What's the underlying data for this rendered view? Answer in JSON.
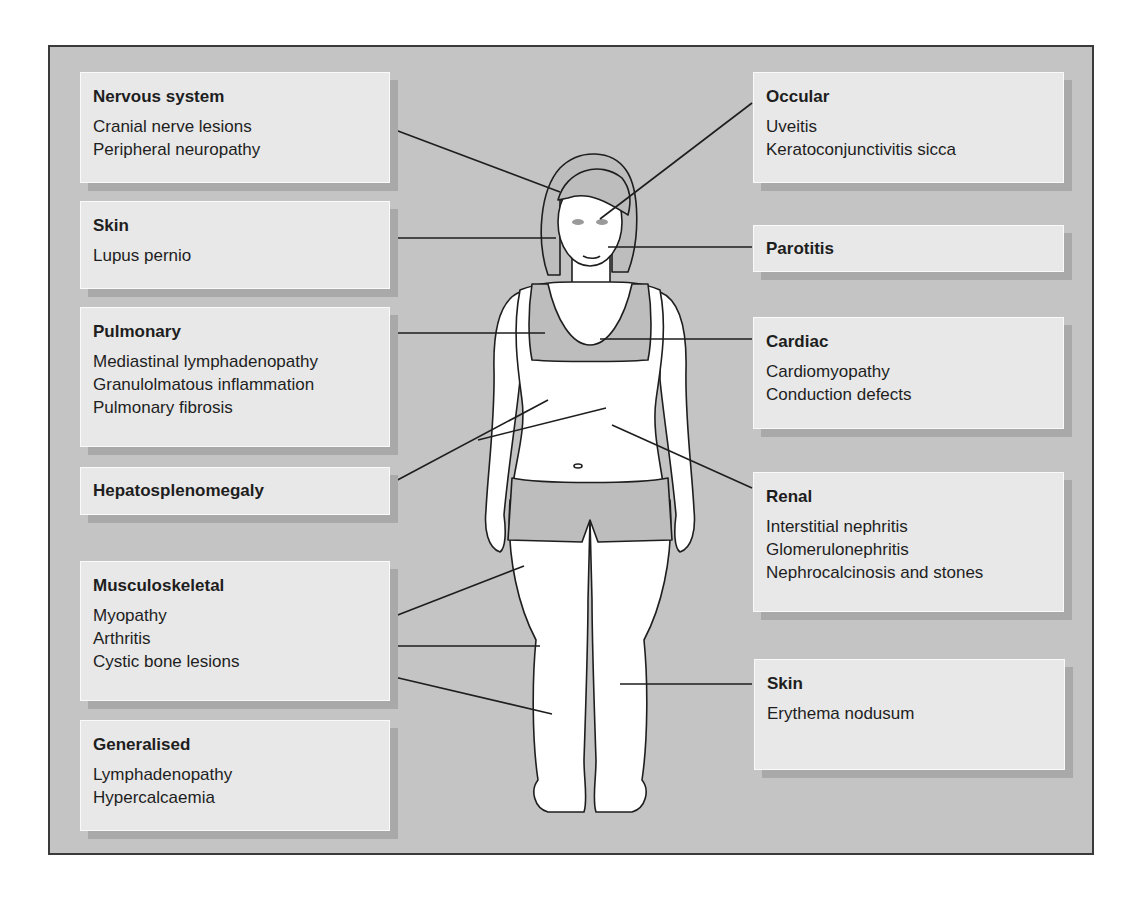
{
  "diagram": {
    "type": "anatomical-annotation",
    "colors": {
      "background": "#c4c4c4",
      "box_fill": "#e8e8e8",
      "box_shadow": "#a9a9a9",
      "clothing": "#bdbdbd",
      "text": "#1e1e1e"
    }
  },
  "left_boxes": [
    {
      "title": "Nervous system",
      "items": [
        "Cranial nerve lesions",
        "Peripheral neuropathy"
      ]
    },
    {
      "title": "Skin",
      "items": [
        "Lupus pernio"
      ]
    },
    {
      "title": "Pulmonary",
      "items": [
        "Mediastinal lymphadenopathy",
        "Granulolmatous inflammation",
        "Pulmonary fibrosis"
      ]
    },
    {
      "title": "Hepatosplenomegaly",
      "items": []
    },
    {
      "title": "Musculoskeletal",
      "items": [
        "Myopathy",
        "Arthritis",
        "Cystic bone lesions"
      ]
    },
    {
      "title": "Generalised",
      "items": [
        "Lymphadenopathy",
        "Hypercalcaemia"
      ]
    }
  ],
  "right_boxes": [
    {
      "title": "Occular",
      "items": [
        "Uveitis",
        "Keratoconjunctivitis sicca"
      ]
    },
    {
      "title": "Parotitis",
      "items": []
    },
    {
      "title": "Cardiac",
      "items": [
        "Cardiomyopathy",
        "Conduction defects"
      ]
    },
    {
      "title": "Renal",
      "items": [
        "Interstitial nephritis",
        "Glomerulonephritis",
        "Nephrocalcinosis and stones"
      ]
    },
    {
      "title": "Skin",
      "items": [
        "Erythema nodusum"
      ]
    }
  ]
}
